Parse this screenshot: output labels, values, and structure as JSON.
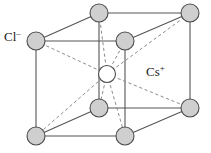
{
  "figure": {
    "name": "cesium-chloride-unit-cell",
    "labels": {
      "anion": {
        "symbol": "Cl",
        "charge": "–",
        "text": "Cl–"
      },
      "cation": {
        "symbol": "Cs",
        "charge": "+",
        "text": "Cs+"
      }
    },
    "colors": {
      "sphere_fill": "#cfcfcf",
      "sphere_stroke": "#4d4d4d",
      "center_fill": "#ffffff",
      "center_stroke": "#4d4d4d",
      "edge_solid": "#555555",
      "edge_dashed": "#8c8c8c",
      "background": "#ffffff",
      "text": "#1a1a1a"
    },
    "geometry": {
      "sphere_radius": 9,
      "center_radius": 8.5,
      "corner_spheres": [
        {
          "id": "front-top-left",
          "cx": 36,
          "cy": 41,
          "element": "Cl"
        },
        {
          "id": "front-top-right",
          "cx": 125,
          "cy": 41,
          "element": "Cl"
        },
        {
          "id": "front-bottom-left",
          "cx": 36,
          "cy": 136,
          "element": "Cl"
        },
        {
          "id": "front-bottom-right",
          "cx": 125,
          "cy": 136,
          "element": "Cl"
        },
        {
          "id": "back-top-left",
          "cx": 99,
          "cy": 13,
          "element": "Cl"
        },
        {
          "id": "back-top-right",
          "cx": 190,
          "cy": 13,
          "element": "Cl"
        },
        {
          "id": "back-bottom-left",
          "cx": 99,
          "cy": 108,
          "element": "Cl"
        },
        {
          "id": "back-bottom-right",
          "cx": 190,
          "cy": 108,
          "element": "Cl"
        }
      ],
      "center_sphere": {
        "id": "body-center",
        "cx": 107,
        "cy": 74,
        "element": "Cs"
      },
      "solid_edges": [
        [
          36,
          41,
          125,
          41
        ],
        [
          36,
          41,
          36,
          136
        ],
        [
          125,
          41,
          125,
          136
        ],
        [
          36,
          136,
          125,
          136
        ],
        [
          99,
          13,
          190,
          13
        ],
        [
          99,
          13,
          99,
          108
        ],
        [
          190,
          13,
          190,
          108
        ],
        [
          99,
          108,
          190,
          108
        ],
        [
          36,
          41,
          99,
          13
        ],
        [
          125,
          41,
          190,
          13
        ],
        [
          36,
          136,
          99,
          108
        ],
        [
          125,
          136,
          190,
          108
        ]
      ],
      "dashed_bonds": [
        [
          107,
          74,
          36,
          41
        ],
        [
          107,
          74,
          125,
          41
        ],
        [
          107,
          74,
          36,
          136
        ],
        [
          107,
          74,
          125,
          136
        ],
        [
          107,
          74,
          99,
          13
        ],
        [
          107,
          74,
          190,
          13
        ],
        [
          107,
          74,
          99,
          108
        ],
        [
          107,
          74,
          190,
          108
        ]
      ]
    }
  }
}
